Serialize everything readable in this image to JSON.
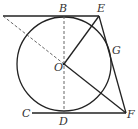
{
  "figure": {
    "type": "geometry-diagram",
    "colors": {
      "stroke": "#222222",
      "dashed": "#555555",
      "label": "#333333",
      "background": "#ffffff"
    },
    "points": {
      "B": "B",
      "E": "E",
      "G": "G",
      "O": "O",
      "C": "C",
      "D": "D",
      "F": "F"
    },
    "segments": [
      {
        "from": "A",
        "to": "E",
        "style": "solid",
        "note": "top tangent line through B"
      },
      {
        "from": "C",
        "to": "F",
        "style": "solid",
        "note": "bottom tangent line through D"
      },
      {
        "from": "E",
        "to": "F",
        "style": "solid",
        "note": "tangent through G"
      },
      {
        "from": "O",
        "to": "E",
        "style": "solid"
      },
      {
        "from": "O",
        "to": "F",
        "style": "solid"
      },
      {
        "from": "B",
        "to": "D",
        "style": "dashed"
      },
      {
        "from": "A",
        "to": "O",
        "style": "dashed"
      }
    ],
    "circle": {
      "center": "O"
    }
  }
}
